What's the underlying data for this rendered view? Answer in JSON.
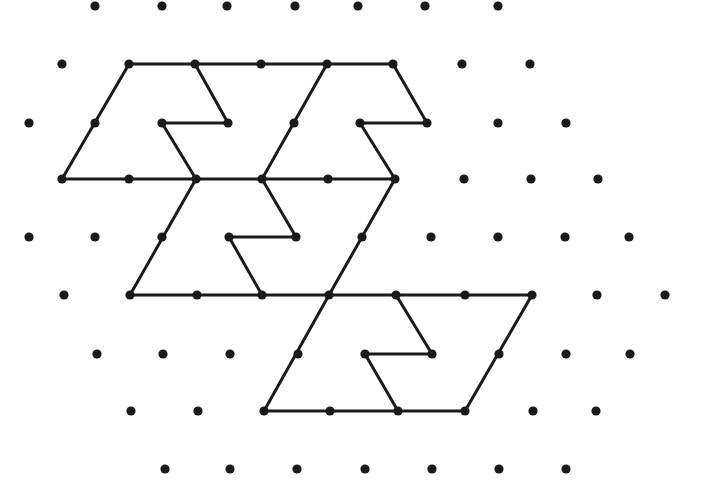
{
  "diagram": {
    "type": "isometric-dot-grid-figure",
    "canvas": {
      "width": 715,
      "height": 485,
      "background": "#ffffff"
    },
    "colors": {
      "ink": "#1a1a1a"
    },
    "dot_radius": 4.6,
    "line_width": 3,
    "dots": [
      [
        95,
        6
      ],
      [
        162,
        6
      ],
      [
        227,
        6
      ],
      [
        295,
        6
      ],
      [
        358,
        6
      ],
      [
        425,
        6
      ],
      [
        498,
        6
      ],
      [
        62,
        64
      ],
      [
        129,
        64
      ],
      [
        195,
        64
      ],
      [
        261,
        64
      ],
      [
        327,
        64
      ],
      [
        393,
        64
      ],
      [
        462,
        64
      ],
      [
        530,
        64
      ],
      [
        29,
        123
      ],
      [
        95,
        123
      ],
      [
        162,
        123
      ],
      [
        228,
        123
      ],
      [
        294,
        123
      ],
      [
        360,
        123
      ],
      [
        427,
        123
      ],
      [
        498,
        123
      ],
      [
        566,
        123
      ],
      [
        62,
        179
      ],
      [
        129,
        179
      ],
      [
        196,
        179
      ],
      [
        262,
        179
      ],
      [
        328,
        179
      ],
      [
        395,
        179
      ],
      [
        464,
        179
      ],
      [
        531,
        179
      ],
      [
        598,
        179
      ],
      [
        29,
        237
      ],
      [
        95,
        237
      ],
      [
        162,
        237
      ],
      [
        229,
        237
      ],
      [
        296,
        237
      ],
      [
        362,
        237
      ],
      [
        431,
        237
      ],
      [
        498,
        237
      ],
      [
        565,
        237
      ],
      [
        629,
        237
      ],
      [
        64,
        295
      ],
      [
        130,
        295
      ],
      [
        197,
        295
      ],
      [
        262,
        295
      ],
      [
        329,
        295
      ],
      [
        396,
        295
      ],
      [
        465,
        295
      ],
      [
        532,
        295
      ],
      [
        597,
        295
      ],
      [
        665,
        295
      ],
      [
        97,
        354
      ],
      [
        163,
        354
      ],
      [
        230,
        354
      ],
      [
        298,
        354
      ],
      [
        365,
        354
      ],
      [
        432,
        354
      ],
      [
        499,
        354
      ],
      [
        566,
        354
      ],
      [
        630,
        354
      ],
      [
        131,
        411
      ],
      [
        198,
        411
      ],
      [
        264,
        411
      ],
      [
        330,
        411
      ],
      [
        398,
        411
      ],
      [
        465,
        411
      ],
      [
        533,
        411
      ],
      [
        596,
        411
      ],
      [
        165,
        469
      ],
      [
        230,
        469
      ],
      [
        297,
        469
      ],
      [
        365,
        469
      ],
      [
        432,
        469
      ],
      [
        499,
        469
      ],
      [
        566,
        469
      ]
    ],
    "shapes": [
      {
        "name": "top-left-piece",
        "segments": [
          [
            [
              129,
              64
            ],
            [
              393,
              64
            ]
          ],
          [
            [
              62,
              179
            ],
            [
              129,
              64
            ]
          ],
          [
            [
              195,
              64
            ],
            [
              228,
              123
            ]
          ],
          [
            [
              228,
              123
            ],
            [
              162,
              123
            ]
          ],
          [
            [
              162,
              123
            ],
            [
              196,
              179
            ]
          ],
          [
            [
              62,
              179
            ],
            [
              395,
              179
            ]
          ]
        ]
      },
      {
        "name": "top-right-piece",
        "segments": [
          [
            [
              393,
              64
            ],
            [
              427,
              123
            ]
          ],
          [
            [
              427,
              123
            ],
            [
              360,
              123
            ]
          ],
          [
            [
              360,
              123
            ],
            [
              395,
              179
            ]
          ],
          [
            [
              327,
              64
            ],
            [
              262,
              179
            ]
          ]
        ]
      },
      {
        "name": "middle-piece",
        "segments": [
          [
            [
              196,
              179
            ],
            [
              130,
              295
            ]
          ],
          [
            [
              262,
              179
            ],
            [
              296,
              237
            ]
          ],
          [
            [
              296,
              237
            ],
            [
              229,
              237
            ]
          ],
          [
            [
              229,
              237
            ],
            [
              262,
              295
            ]
          ],
          [
            [
              395,
              179
            ],
            [
              329,
              295
            ]
          ],
          [
            [
              130,
              295
            ],
            [
              532,
              295
            ]
          ]
        ]
      },
      {
        "name": "bottom-piece",
        "segments": [
          [
            [
              396,
              295
            ],
            [
              432,
              354
            ]
          ],
          [
            [
              432,
              354
            ],
            [
              365,
              354
            ]
          ],
          [
            [
              365,
              354
            ],
            [
              398,
              411
            ]
          ],
          [
            [
              532,
              295
            ],
            [
              465,
              411
            ]
          ],
          [
            [
              329,
              295
            ],
            [
              264,
              411
            ]
          ],
          [
            [
              264,
              411
            ],
            [
              465,
              411
            ]
          ]
        ]
      }
    ]
  }
}
